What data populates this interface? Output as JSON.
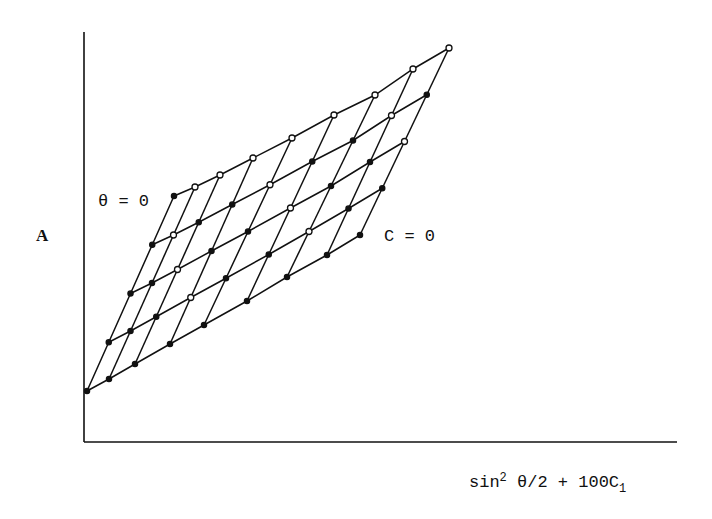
{
  "chart_data": {
    "type": "line",
    "subtype": "zimm-plot-grid",
    "title": "",
    "xlabel": "sin² θ/2 + 100C₁",
    "ylabel": "A",
    "annotations": [
      {
        "text": "θ = 0",
        "target": "leftmost steep line (extrapolated zero angle)"
      },
      {
        "text": "C = 0",
        "target": "lowest shallow line (extrapolated zero concentration)"
      }
    ],
    "axes": {
      "x_ticks": [],
      "y_ticks": [],
      "grid": false,
      "legend": false
    },
    "grid_structure": {
      "concentration_levels": 5,
      "angle_levels": 9,
      "description": "Shallow lines connect points of constant concentration (C = 0 at bottom); steep lines connect points of constant angle (θ = 0 at left). Open circles mark measured points near top/right, filled dots mark other points."
    },
    "pixel_geometry": {
      "axes_origin": [
        84,
        442
      ],
      "y_axis_top": 32,
      "x_axis_right": 677,
      "c0_line": [
        [
          87,
          391
        ],
        [
          109,
          379
        ],
        [
          135,
          364
        ],
        [
          170,
          344
        ],
        [
          204,
          325
        ],
        [
          247,
          301
        ],
        [
          287,
          277
        ],
        [
          327,
          255
        ],
        [
          360,
          235
        ]
      ],
      "top_line": [
        [
          174,
          196
        ],
        [
          195,
          187
        ],
        [
          220,
          175
        ],
        [
          253,
          158
        ],
        [
          292,
          138
        ],
        [
          334,
          115
        ],
        [
          375,
          95
        ],
        [
          413,
          69
        ],
        [
          449,
          48
        ]
      ]
    },
    "series": [
      {
        "name": "C = 0 (extrapolated)",
        "marker": "filled"
      },
      {
        "name": "C level 1",
        "marker": "mixed"
      },
      {
        "name": "C level 2",
        "marker": "mixed"
      },
      {
        "name": "C level 3",
        "marker": "mixed"
      },
      {
        "name": "C level 4 (highest)",
        "marker": "open"
      }
    ]
  },
  "labels": {
    "ylabel": "A",
    "theta_annotation": "θ = 0",
    "c_annotation": "C = 0",
    "xlabel_main": "sin",
    "xlabel_sup": "2",
    "xlabel_mid": " θ/2 + 100C",
    "xlabel_sub": "1"
  },
  "style": {
    "ink": "#111111",
    "background": "#ffffff"
  }
}
